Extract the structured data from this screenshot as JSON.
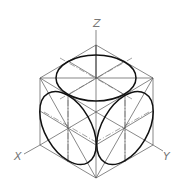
{
  "diagram": {
    "axes": {
      "z_label": "Z",
      "x_label": "X",
      "y_label": "Y"
    },
    "colors": {
      "line": "#555555",
      "outline": "#111111",
      "label": "#777777",
      "background": "#ffffff"
    }
  }
}
